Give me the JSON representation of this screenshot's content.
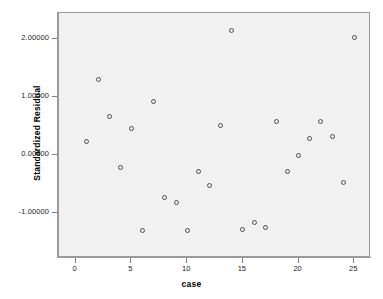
{
  "chart_data": {
    "type": "scatter",
    "title": "",
    "xlabel": "case",
    "ylabel": "Standardized Residual",
    "xlim": [
      -1.5,
      26.5
    ],
    "ylim": [
      -1.78,
      2.45
    ],
    "xticks": [
      0,
      5,
      10,
      15,
      20,
      25
    ],
    "xtick_labels": [
      "0",
      "5",
      "10",
      "15",
      "20",
      "25"
    ],
    "yticks": [
      2.0,
      1.0,
      0.0,
      -1.0
    ],
    "ytick_labels": [
      "2.00000",
      "1.00000",
      "0.00000",
      "-1.00000"
    ],
    "grid": false,
    "legend": false,
    "marker": "open-circle",
    "marker_color": "#4d4d4d",
    "plot_background": "#f1f1f1",
    "frame_color": "#9a9a9a",
    "x": [
      1,
      2,
      3,
      4,
      5,
      6,
      7,
      8,
      9,
      10,
      11,
      12,
      13,
      14,
      15,
      16,
      17,
      18,
      19,
      20,
      21,
      22,
      23,
      24,
      25
    ],
    "y": [
      0.24,
      1.3,
      0.67,
      -0.21,
      0.46,
      -1.31,
      0.93,
      -0.74,
      -0.82,
      -1.31,
      -0.28,
      -0.53,
      0.51,
      2.14,
      -1.29,
      -1.17,
      -1.26,
      0.58,
      -0.28,
      -0.01,
      0.28,
      0.58,
      0.31,
      -0.48,
      2.02
    ],
    "points": [
      {
        "case": 1,
        "value": 0.24
      },
      {
        "case": 2,
        "value": 1.3
      },
      {
        "case": 3,
        "value": 0.67
      },
      {
        "case": 4,
        "value": -0.21
      },
      {
        "case": 5,
        "value": 0.46
      },
      {
        "case": 6,
        "value": -1.31
      },
      {
        "case": 7,
        "value": 0.93
      },
      {
        "case": 8,
        "value": -0.74
      },
      {
        "case": 9,
        "value": -0.82
      },
      {
        "case": 10,
        "value": -1.31
      },
      {
        "case": 11,
        "value": -0.28
      },
      {
        "case": 12,
        "value": -0.53
      },
      {
        "case": 13,
        "value": 0.51
      },
      {
        "case": 14,
        "value": 2.14
      },
      {
        "case": 15,
        "value": -1.29
      },
      {
        "case": 16,
        "value": -1.17
      },
      {
        "case": 17,
        "value": -1.26
      },
      {
        "case": 18,
        "value": 0.58
      },
      {
        "case": 19,
        "value": -0.28
      },
      {
        "case": 20,
        "value": -0.01
      },
      {
        "case": 21,
        "value": 0.28
      },
      {
        "case": 22,
        "value": 0.58
      },
      {
        "case": 23,
        "value": 0.31
      },
      {
        "case": 24,
        "value": -0.48
      },
      {
        "case": 25,
        "value": 2.02
      }
    ]
  }
}
